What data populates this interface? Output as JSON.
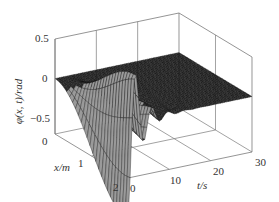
{
  "chart_data": {
    "type": "surface3d",
    "title": "",
    "xlabel": "x/m",
    "ylabel": "t/s",
    "zlabel": "φ(x, t)/rad",
    "xlim": [
      0,
      2
    ],
    "tlim": [
      0,
      30
    ],
    "zlim": [
      -0.7,
      0.5
    ],
    "x_ticks": [
      "0",
      "1",
      "2"
    ],
    "t_ticks": [
      "0",
      "10",
      "20",
      "30"
    ],
    "z_ticks": [
      "0.5",
      "0",
      "−0.5"
    ],
    "grid": true,
    "surface_model": {
      "amplitude": -0.62,
      "decay_rate": 0.38,
      "oscillation_freq": 1.6,
      "x_shape": "sin(pi*x/4)^2 growth toward x=2",
      "x_samples": 26,
      "t_samples": 60
    },
    "colors": {
      "surface_face": "#2a2a2a",
      "surface_mesh": "#0d0d0d",
      "dip_face": "#9a9a9a",
      "axes": "#7a7a7a",
      "text": "#333333"
    }
  },
  "labels": {
    "z_tick_top": "0.5",
    "z_tick_mid": "0",
    "z_tick_bot": "−0.5",
    "x_tick_0": "0",
    "x_tick_1": "1",
    "x_tick_2": "2",
    "t_tick_0": "0",
    "t_tick_10": "10",
    "t_tick_20": "20",
    "t_tick_30": "30",
    "x_axis_title": "x/m",
    "t_axis_title": "t/s",
    "z_axis_title": "φ(x, t)/rad"
  }
}
